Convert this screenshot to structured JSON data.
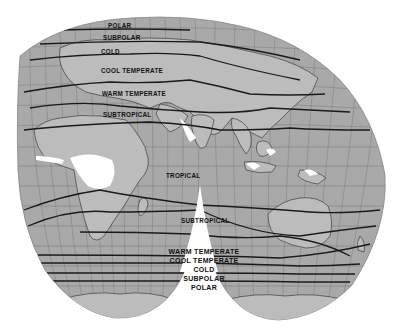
{
  "map": {
    "title": "Climatic zones (interrupted world projection)",
    "projection": "interrupted equal-area, two southern lobes",
    "colors": {
      "ocean": "#a9a9a9",
      "land": "#c4c4c4",
      "desert_ice": "#ffffff",
      "zone_line": "#1a1a1a",
      "graticule": "#555555",
      "background": "#ffffff"
    },
    "northern_labels": [
      {
        "id": "polar",
        "text": "POLAR"
      },
      {
        "id": "subpolar",
        "text": "SUBPOLAR"
      },
      {
        "id": "cold",
        "text": "COLD"
      },
      {
        "id": "cool_temperate",
        "text": "COOL TEMPERATE"
      },
      {
        "id": "warm_temperate",
        "text": "WARM TEMPERATE"
      },
      {
        "id": "subtropical",
        "text": "SUBTROPICAL"
      }
    ],
    "equatorial_label": "TROPICAL",
    "southern_labels": {
      "subtropical": "SUBTROPICAL",
      "stack": [
        "WARM TEMPERATE",
        "COOL TEMPERATE",
        "COLD",
        "SUBPOLAR",
        "POLAR"
      ]
    }
  }
}
